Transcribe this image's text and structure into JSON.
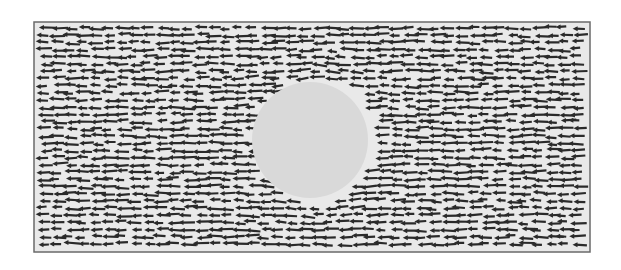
{
  "figure": {
    "frame": {
      "x": 34,
      "y": 22,
      "width": 556,
      "height": 230,
      "stroke": "#6a6a6a"
    },
    "background": "#e9e9e9",
    "obstacle": {
      "cx": 310,
      "cy": 140,
      "r": 58,
      "fill": "#d9d9d9"
    },
    "arrow_color": "#2a2a2a",
    "arrow_direction": "left",
    "arrow_length": 14,
    "grid": {
      "dx": 13,
      "dy": 7.2
    }
  }
}
